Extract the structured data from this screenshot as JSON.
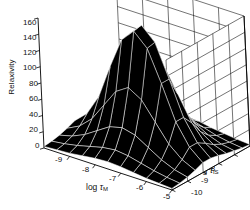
{
  "figure": {
    "title": "",
    "background": "#ffffff",
    "ink": "#000000",
    "mesh_face_color": "#000000",
    "mesh_line_color": "#ffffff",
    "box_line_color": "#000000"
  },
  "axes": {
    "z": {
      "label": "Relaxivity",
      "ticks": [
        "0",
        "20",
        "40",
        "60",
        "80",
        "100",
        "120",
        "140",
        "160"
      ],
      "min": 0,
      "max": 160,
      "step": 20
    },
    "x": {
      "label_prefix": "log ",
      "label_symbol": "τ",
      "label_sub": "M",
      "label": "log τM",
      "ticks": [
        "-9",
        "-8",
        "-7",
        "-6",
        "-5"
      ],
      "min": -10,
      "max": -5
    },
    "y": {
      "label_prefix": "log ",
      "label_symbol": "τ",
      "label_sub": "IS",
      "label": "log τIS",
      "ticks": [
        "-5",
        "-6",
        "-7",
        "-8",
        "-9",
        "-10"
      ],
      "min": -10,
      "max": -5
    }
  },
  "chart_data": {
    "type": "surface",
    "title": "",
    "xlabel": "log τM",
    "ylabel": "log τIS",
    "zlabel": "Relaxivity",
    "xlim": [
      -10,
      -5
    ],
    "ylim": [
      -10,
      -5
    ],
    "zlim": [
      0,
      160
    ],
    "grid": true,
    "legend": "none",
    "x": [
      -10,
      -9.5,
      -9,
      -8.5,
      -8,
      -7.5,
      -7,
      -6.5,
      -6,
      -5.5,
      -5
    ],
    "y": [
      -10,
      -9.5,
      -9,
      -8.5,
      -8,
      -7.5,
      -7,
      -6.5,
      -6,
      -5.5,
      -5
    ],
    "z_rows": [
      [
        2,
        3,
        4,
        6,
        8,
        9,
        8,
        6,
        4,
        3,
        2
      ],
      [
        3,
        5,
        8,
        12,
        16,
        18,
        16,
        12,
        8,
        5,
        3
      ],
      [
        5,
        9,
        16,
        26,
        36,
        40,
        36,
        26,
        16,
        9,
        5
      ],
      [
        8,
        16,
        30,
        52,
        74,
        84,
        74,
        52,
        30,
        16,
        8
      ],
      [
        12,
        26,
        52,
        94,
        132,
        148,
        132,
        94,
        52,
        26,
        12
      ],
      [
        12,
        26,
        52,
        94,
        134,
        150,
        134,
        94,
        52,
        26,
        12
      ],
      [
        10,
        20,
        40,
        70,
        100,
        112,
        100,
        70,
        40,
        20,
        10
      ],
      [
        7,
        13,
        24,
        41,
        58,
        64,
        58,
        41,
        24,
        13,
        7
      ],
      [
        5,
        8,
        14,
        23,
        32,
        36,
        32,
        23,
        14,
        8,
        5
      ],
      [
        3,
        5,
        8,
        13,
        18,
        20,
        18,
        13,
        8,
        5,
        3
      ],
      [
        2,
        3,
        5,
        7,
        10,
        11,
        10,
        7,
        5,
        3,
        2
      ]
    ],
    "peak_value": 150,
    "peak_at": {
      "x": -7.5,
      "y": -8.0
    }
  }
}
